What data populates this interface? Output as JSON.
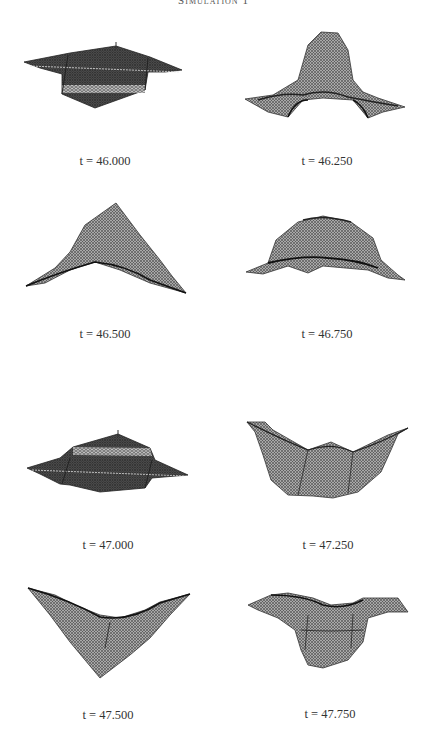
{
  "figure": {
    "title": "Simulation 1",
    "panels": [
      {
        "label": "t = 46.000",
        "shape": "flat-winged"
      },
      {
        "label": "t = 46.250",
        "shape": "central-peak"
      },
      {
        "label": "t = 46.500",
        "shape": "pyramid-peak"
      },
      {
        "label": "t = 46.750",
        "shape": "dome"
      },
      {
        "label": "t = 47.000",
        "shape": "flat-winged"
      },
      {
        "label": "t = 47.250",
        "shape": "bowl"
      },
      {
        "label": "t = 47.500",
        "shape": "inverted-peak"
      },
      {
        "label": "t = 47.750",
        "shape": "trough"
      }
    ]
  },
  "colors": {
    "mesh_dark": "#3a3a3a",
    "mesh_mid": "#6e6e6e",
    "mesh_light": "#bdbdbd",
    "background": "#ffffff",
    "text": "#333333"
  }
}
